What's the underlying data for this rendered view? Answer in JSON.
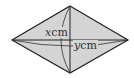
{
  "diagram": {
    "shape": "rhombus",
    "fill_color": "#d4d4d4",
    "stroke_color": "#222222",
    "vertices": {
      "top": [
        70,
        6
      ],
      "right": [
        128,
        40
      ],
      "bottom": [
        70,
        73
      ],
      "left": [
        12,
        40
      ]
    },
    "labels": {
      "vertical_diagonal": {
        "var": "x",
        "unit": "cm"
      },
      "horizontal_diagonal": {
        "var": "y",
        "unit": "cm"
      }
    }
  }
}
